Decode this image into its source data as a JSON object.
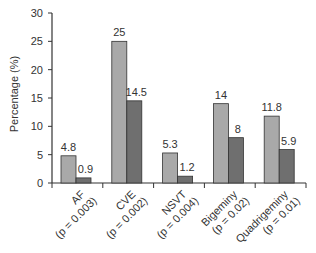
{
  "chart_data": {
    "type": "bar",
    "title": "",
    "xlabel": "",
    "ylabel": "Percentage (%)",
    "ylim": [
      0,
      30
    ],
    "yticks": [
      0,
      5,
      10,
      15,
      20,
      25,
      30
    ],
    "grid": false,
    "legend": null,
    "categories": [
      "AF",
      "CVE",
      "NSVT",
      "Bigeminy",
      "Quadrigeminy"
    ],
    "category_pvalues": [
      "(p = 0.003)",
      "(p = 0.002)",
      "(p = 0.004)",
      "(p = 0.02)",
      "(p = 0.01)"
    ],
    "series": [
      {
        "name": "Group 1",
        "color": "#a9a9a9",
        "values": [
          4.8,
          25,
          5.3,
          14,
          11.8
        ]
      },
      {
        "name": "Group 2",
        "color": "#6f6f6f",
        "values": [
          0.9,
          14.5,
          1.2,
          8,
          5.9
        ]
      }
    ],
    "data_labels": [
      [
        "4.8",
        "25",
        "5.3",
        "14",
        "11.8"
      ],
      [
        "0.9",
        "14.5",
        "1.2",
        "8",
        "5.9"
      ]
    ]
  }
}
